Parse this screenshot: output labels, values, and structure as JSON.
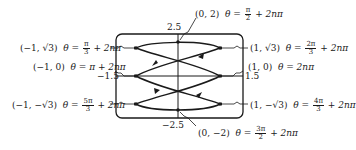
{
  "diagram": {
    "window": {
      "xmin": -1.5,
      "xmax": 1.5,
      "ymin": -2.5,
      "ymax": 2.5
    },
    "ticks": {
      "ymax": "2.5",
      "ymin": "−2.5",
      "xmin": "−1.5",
      "xmax": "1.5"
    },
    "points": [
      {
        "id": "top",
        "coord": "(0, 2)",
        "theta_eq": "θ =",
        "frac_num": "π",
        "frac_den": "2",
        "suffix": "+ 2nπ"
      },
      {
        "id": "upper-left",
        "coord": "(−1, √3)",
        "theta_eq": "θ =",
        "frac_num": "π",
        "frac_den": "3",
        "suffix": "+ 2nπ"
      },
      {
        "id": "upper-right",
        "coord": "(1, √3)",
        "theta_eq": "θ =",
        "frac_num": "2π",
        "frac_den": "3",
        "suffix": "+ 2nπ"
      },
      {
        "id": "mid-left",
        "coord": "(−1, 0)",
        "theta_eq": "θ = π + 2nπ"
      },
      {
        "id": "mid-right",
        "coord": "(1, 0)",
        "theta_eq": "θ = 2nπ"
      },
      {
        "id": "lower-left",
        "coord": "(−1, −√3)",
        "theta_eq": "θ =",
        "frac_num": "5π",
        "frac_den": "3",
        "suffix": "+ 2nπ"
      },
      {
        "id": "lower-right",
        "coord": "(1, −√3)",
        "theta_eq": "θ =",
        "frac_num": "4π",
        "frac_den": "3",
        "suffix": "+ 2nπ"
      },
      {
        "id": "bottom",
        "coord": "(0, −2)",
        "theta_eq": "θ =",
        "frac_num": "3π",
        "frac_den": "2",
        "suffix": "+ 2nπ"
      }
    ],
    "colors": {
      "ink": "#1a1a1a",
      "background": "#ffffff"
    }
  }
}
